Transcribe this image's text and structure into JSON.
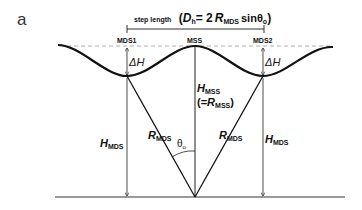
{
  "figure": {
    "panel_label": "a",
    "step_length": {
      "prefix": "step length",
      "formula_open": "(",
      "D": "D",
      "D_sub": "h",
      "eq": "= 2",
      "R": "R",
      "R_sub": "MDS",
      "sin": "sinθ",
      "sin_sub": "o",
      "formula_close": ")"
    },
    "points": {
      "mds1": "MDS1",
      "mss": "MSS",
      "mds2": "MDS2"
    },
    "labels": {
      "delta_h": "ΔH",
      "h_main": "H",
      "h_mds_sub": "MDS",
      "h_mss_sub": "MSS",
      "r_main": "R",
      "r_mds_sub": "MDS",
      "r_mss_sub": "MSS",
      "eq_open": "(=",
      "eq_close": ")",
      "theta": "θ",
      "theta_sub": "o"
    }
  }
}
